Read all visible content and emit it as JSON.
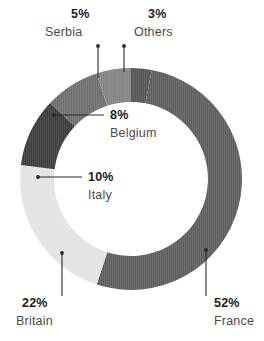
{
  "chart_data": {
    "type": "pie",
    "variant": "donut",
    "title": "",
    "subtitle": "",
    "xlabel": "",
    "ylabel": "",
    "legend_position": "none",
    "grid": false,
    "units": "percent",
    "total": 100,
    "categories": [
      "France",
      "Britain",
      "Italy",
      "Belgium",
      "Serbia",
      "Others"
    ],
    "values": [
      52,
      22,
      10,
      8,
      5,
      3
    ],
    "slices": [
      {
        "label": "France",
        "value": 52,
        "value_text": "52%",
        "color": "#5d5d5d",
        "start_angle": 10.8,
        "end_angle": 198.0,
        "label_x": 214,
        "label_y": 307,
        "name_x": 214,
        "name_y": 325,
        "leader_x1": 206,
        "leader_y1": 250,
        "leader_x2": 206,
        "leader_y2": 296
      },
      {
        "label": "Britain",
        "value": 22,
        "value_text": "22%",
        "color": "#e3e3e3",
        "start_angle": 198.0,
        "end_angle": 277.2,
        "label_x": 22,
        "label_y": 307,
        "name_x": 16,
        "name_y": 325,
        "leader_x1": 62,
        "leader_y1": 253,
        "leader_x2": 62,
        "leader_y2": 296
      },
      {
        "label": "Italy",
        "value": 10,
        "value_text": "10%",
        "color": "#3c3c3c",
        "start_angle": 277.2,
        "end_angle": 313.2,
        "label_x": 88,
        "label_y": 181,
        "name_x": 88,
        "name_y": 199,
        "leader_x1": 38,
        "leader_y1": 177,
        "leader_x2": 82,
        "leader_y2": 177
      },
      {
        "label": "Belgium",
        "value": 8,
        "value_text": "8%",
        "color": "#6e6e6e",
        "start_angle": 313.2,
        "end_angle": 342.0,
        "label_x": 110,
        "label_y": 119,
        "name_x": 110,
        "name_y": 137,
        "leader_x1": 54,
        "leader_y1": 115,
        "leader_x2": 104,
        "leader_y2": 115
      },
      {
        "label": "Serbia",
        "value": 5,
        "value_text": "5%",
        "color": "#848484",
        "start_angle": 342.0,
        "end_angle": 360.0,
        "label_x": 71,
        "label_y": 18,
        "name_x": 45,
        "name_y": 36,
        "leader_x1": 98,
        "leader_y1": 46,
        "leader_x2": 98,
        "leader_y2": 78
      },
      {
        "label": "Others",
        "value": 3,
        "value_text": "3%",
        "color": "#555555",
        "start_angle": 0.0,
        "end_angle": 10.8,
        "label_x": 148,
        "label_y": 18,
        "name_x": 134,
        "name_y": 36,
        "leader_x1": 124,
        "leader_y1": 46,
        "leader_x2": 124,
        "leader_y2": 72
      }
    ],
    "geometry": {
      "center_x": 131,
      "center_y": 179,
      "outer_radius": 111,
      "inner_radius": 77
    }
  }
}
